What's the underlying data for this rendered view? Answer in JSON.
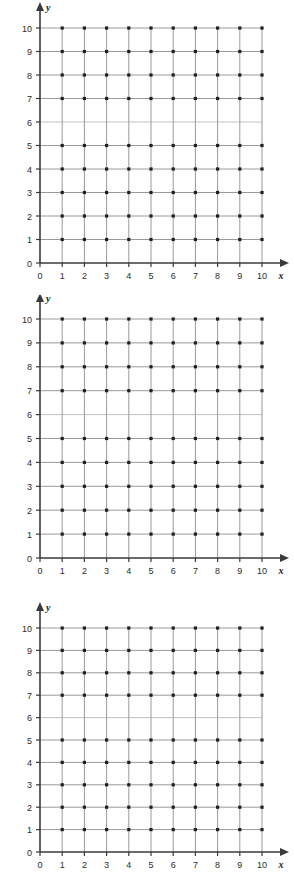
{
  "page": {
    "background_color": "#ffffff",
    "figure_count": 3
  },
  "style": {
    "gridline_color": "#9a9a9a",
    "faded_gridline_color": "#c2c2c2",
    "axis_color": "#3a3a3a",
    "dot_color": "#1f1f1f",
    "label_color": "#2b2b2b"
  },
  "axis_labels": {
    "x_name": "x",
    "y_name": "y"
  },
  "tick_labels": {
    "x": [
      "0",
      "1",
      "2",
      "3",
      "4",
      "5",
      "6",
      "7",
      "8",
      "9",
      "10"
    ],
    "y": [
      "0",
      "1",
      "2",
      "3",
      "4",
      "5",
      "6",
      "7",
      "8",
      "9",
      "10"
    ]
  },
  "chart_data": [
    {
      "type": "scatter",
      "title": "",
      "xlabel": "x",
      "ylabel": "y",
      "xlim": [
        0,
        10
      ],
      "ylim": [
        0,
        10
      ],
      "xticks": [
        0,
        1,
        2,
        3,
        4,
        5,
        6,
        7,
        8,
        9,
        10
      ],
      "yticks": [
        0,
        1,
        2,
        3,
        4,
        5,
        6,
        7,
        8,
        9,
        10
      ],
      "grid": true,
      "legend": "none",
      "series": [
        {
          "name": "lattice points",
          "note": "dots at every integer intersection from x=1..10, y=1..10; the y=6 row gridline is printed faint with no visible dots",
          "x": [
            1,
            2,
            3,
            4,
            5,
            6,
            7,
            8,
            9,
            10,
            1,
            2,
            3,
            4,
            5,
            6,
            7,
            8,
            9,
            10,
            1,
            2,
            3,
            4,
            5,
            6,
            7,
            8,
            9,
            10,
            1,
            2,
            3,
            4,
            5,
            6,
            7,
            8,
            9,
            10,
            1,
            2,
            3,
            4,
            5,
            6,
            7,
            8,
            9,
            10,
            1,
            2,
            3,
            4,
            5,
            6,
            7,
            8,
            9,
            10,
            1,
            2,
            3,
            4,
            5,
            6,
            7,
            8,
            9,
            10,
            1,
            2,
            3,
            4,
            5,
            6,
            7,
            8,
            9,
            10,
            1,
            2,
            3,
            4,
            5,
            6,
            7,
            8,
            9,
            10
          ],
          "y": [
            1,
            1,
            1,
            1,
            1,
            1,
            1,
            1,
            1,
            1,
            2,
            2,
            2,
            2,
            2,
            2,
            2,
            2,
            2,
            2,
            3,
            3,
            3,
            3,
            3,
            3,
            3,
            3,
            3,
            3,
            4,
            4,
            4,
            4,
            4,
            4,
            4,
            4,
            4,
            4,
            5,
            5,
            5,
            5,
            5,
            5,
            5,
            5,
            5,
            5,
            7,
            7,
            7,
            7,
            7,
            7,
            7,
            7,
            7,
            7,
            8,
            8,
            8,
            8,
            8,
            8,
            8,
            8,
            8,
            8,
            9,
            9,
            9,
            9,
            9,
            9,
            9,
            9,
            9,
            9,
            10,
            10,
            10,
            10,
            10,
            10,
            10,
            10,
            10,
            10
          ]
        }
      ]
    },
    {
      "type": "scatter",
      "title": "",
      "xlabel": "x",
      "ylabel": "y",
      "xlim": [
        0,
        10
      ],
      "ylim": [
        0,
        10
      ],
      "xticks": [
        0,
        1,
        2,
        3,
        4,
        5,
        6,
        7,
        8,
        9,
        10
      ],
      "yticks": [
        0,
        1,
        2,
        3,
        4,
        5,
        6,
        7,
        8,
        9,
        10
      ],
      "grid": true,
      "legend": "none",
      "series": [
        {
          "name": "lattice points",
          "note": "dots at every integer intersection from x=1..10, y=1..10; the y=6 row gridline is printed faint with no visible dots",
          "x": [
            1,
            2,
            3,
            4,
            5,
            6,
            7,
            8,
            9,
            10,
            1,
            2,
            3,
            4,
            5,
            6,
            7,
            8,
            9,
            10,
            1,
            2,
            3,
            4,
            5,
            6,
            7,
            8,
            9,
            10,
            1,
            2,
            3,
            4,
            5,
            6,
            7,
            8,
            9,
            10,
            1,
            2,
            3,
            4,
            5,
            6,
            7,
            8,
            9,
            10,
            1,
            2,
            3,
            4,
            5,
            6,
            7,
            8,
            9,
            10,
            1,
            2,
            3,
            4,
            5,
            6,
            7,
            8,
            9,
            10,
            1,
            2,
            3,
            4,
            5,
            6,
            7,
            8,
            9,
            10,
            1,
            2,
            3,
            4,
            5,
            6,
            7,
            8,
            9,
            10
          ],
          "y": [
            1,
            1,
            1,
            1,
            1,
            1,
            1,
            1,
            1,
            1,
            2,
            2,
            2,
            2,
            2,
            2,
            2,
            2,
            2,
            2,
            3,
            3,
            3,
            3,
            3,
            3,
            3,
            3,
            3,
            3,
            4,
            4,
            4,
            4,
            4,
            4,
            4,
            4,
            4,
            4,
            5,
            5,
            5,
            5,
            5,
            5,
            5,
            5,
            5,
            5,
            7,
            7,
            7,
            7,
            7,
            7,
            7,
            7,
            7,
            7,
            8,
            8,
            8,
            8,
            8,
            8,
            8,
            8,
            8,
            8,
            9,
            9,
            9,
            9,
            9,
            9,
            9,
            9,
            9,
            9,
            10,
            10,
            10,
            10,
            10,
            10,
            10,
            10,
            10,
            10
          ]
        }
      ]
    },
    {
      "type": "scatter",
      "title": "",
      "xlabel": "x",
      "ylabel": "y",
      "xlim": [
        0,
        10
      ],
      "ylim": [
        0,
        10
      ],
      "xticks": [
        0,
        1,
        2,
        3,
        4,
        5,
        6,
        7,
        8,
        9,
        10
      ],
      "yticks": [
        0,
        1,
        2,
        3,
        4,
        5,
        6,
        7,
        8,
        9,
        10
      ],
      "grid": true,
      "legend": "none",
      "series": [
        {
          "name": "lattice points",
          "note": "dots at every integer intersection from x=1..10, y=1..10; the y=6 row gridline is printed faint with no visible dots",
          "x": [
            1,
            2,
            3,
            4,
            5,
            6,
            7,
            8,
            9,
            10,
            1,
            2,
            3,
            4,
            5,
            6,
            7,
            8,
            9,
            10,
            1,
            2,
            3,
            4,
            5,
            6,
            7,
            8,
            9,
            10,
            1,
            2,
            3,
            4,
            5,
            6,
            7,
            8,
            9,
            10,
            1,
            2,
            3,
            4,
            5,
            6,
            7,
            8,
            9,
            10,
            1,
            2,
            3,
            4,
            5,
            6,
            7,
            8,
            9,
            10,
            1,
            2,
            3,
            4,
            5,
            6,
            7,
            8,
            9,
            10,
            1,
            2,
            3,
            4,
            5,
            6,
            7,
            8,
            9,
            10,
            1,
            2,
            3,
            4,
            5,
            6,
            7,
            8,
            9,
            10
          ],
          "y": [
            1,
            1,
            1,
            1,
            1,
            1,
            1,
            1,
            1,
            1,
            2,
            2,
            2,
            2,
            2,
            2,
            2,
            2,
            2,
            2,
            3,
            3,
            3,
            3,
            3,
            3,
            3,
            3,
            3,
            3,
            4,
            4,
            4,
            4,
            4,
            4,
            4,
            4,
            4,
            4,
            5,
            5,
            5,
            5,
            5,
            5,
            5,
            5,
            5,
            5,
            7,
            7,
            7,
            7,
            7,
            7,
            7,
            7,
            7,
            7,
            8,
            8,
            8,
            8,
            8,
            8,
            8,
            8,
            8,
            8,
            9,
            9,
            9,
            9,
            9,
            9,
            9,
            9,
            9,
            9,
            10,
            10,
            10,
            10,
            10,
            10,
            10,
            10,
            10,
            10
          ]
        }
      ]
    }
  ]
}
